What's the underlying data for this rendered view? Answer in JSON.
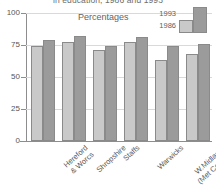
{
  "chart_data": {
    "type": "bar",
    "title": "in education, 1986 and 1993",
    "caption": "Percentages",
    "xlabel": "",
    "ylabel": "",
    "ylim": [
      0,
      100
    ],
    "yticks": [
      0,
      25,
      50,
      75,
      100
    ],
    "grid": true,
    "legend_position": "top-right",
    "categories": [
      "Hereford & Worcs",
      "Shropshire",
      "Staffs",
      "Warwicks",
      "W.Midlands (Met County)",
      "West Midlands"
    ],
    "category_lines": [
      [
        "Hereford",
        "& Worcs"
      ],
      [
        "Shropshire"
      ],
      [
        "Staffs"
      ],
      [
        "Warwicks"
      ],
      [
        "W.Midlands",
        "(Met County)"
      ],
      [
        "West Midlands"
      ]
    ],
    "category_emphasis": [
      false,
      false,
      false,
      false,
      false,
      true
    ],
    "series": [
      {
        "name": "1986",
        "color": "#c9c9c9",
        "values": [
          74,
          77,
          71,
          77,
          63,
          68
        ]
      },
      {
        "name": "1993",
        "color": "#9b9b9b",
        "values": [
          79,
          82,
          74,
          81,
          74,
          76
        ]
      }
    ]
  },
  "axis": {
    "tick_labels": [
      "100",
      "75",
      "50",
      "25",
      "0"
    ]
  },
  "legend": {
    "entries": [
      {
        "label": "1993"
      },
      {
        "label": "1986"
      }
    ]
  }
}
